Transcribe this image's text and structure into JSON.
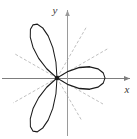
{
  "figure": {
    "title": "",
    "background_color": "#ffffff",
    "width": 137,
    "height": 139
  },
  "axes": {
    "x_label": "x",
    "y_label": "y",
    "x_axis_color": "#7d7d7d",
    "y_axis_color": "#9a9a9a",
    "origin_px": [
      57,
      78
    ],
    "arrowheads": true
  },
  "curve": {
    "label": "",
    "color": "#1a1a1a",
    "line_width": 1.0,
    "style": "solid"
  },
  "tangent_lines": {
    "color": "#b0b0b0",
    "style": "dashed",
    "dash_pattern": "3 2",
    "line_width": 0.8,
    "count": 6
  },
  "chart_data": {
    "type": "line",
    "title": "",
    "xlabel": "x",
    "ylabel": "y",
    "subtitle": "",
    "grid": false,
    "legend": [],
    "legend_position": "none",
    "coordinate_system": "polar",
    "equation": "r = cos(3θ)",
    "petals": 3,
    "petal_angles_deg": [
      0,
      120,
      240
    ],
    "petal_tip_radius": 1.0,
    "tangent_angles_deg": [
      30,
      90,
      150,
      210,
      270,
      330
    ],
    "xlim": [
      -1.15,
      1.55
    ],
    "ylim": [
      -1.6,
      1.6
    ],
    "annotations": [
      {
        "text": "y",
        "x": 0.05,
        "y": 1.52
      },
      {
        "text": "x",
        "x": 1.48,
        "y": -0.22
      }
    ],
    "series": [
      {
        "name": "r = cos(3θ)",
        "theta_deg": [
          0,
          5,
          10,
          15,
          20,
          25,
          30,
          35,
          40,
          45,
          50,
          55,
          60,
          65,
          70,
          75,
          80,
          85,
          90,
          95,
          100,
          105,
          110,
          115,
          120,
          125,
          130,
          135,
          140,
          145,
          150,
          155,
          160,
          165,
          170,
          175,
          180,
          185,
          190,
          195,
          200,
          205,
          210,
          215,
          220,
          225,
          230,
          235,
          240,
          245,
          250,
          255,
          260,
          265,
          270,
          275,
          280,
          285,
          290,
          295,
          300,
          305,
          310,
          315,
          320,
          325,
          330,
          335,
          340,
          345,
          350,
          355,
          360
        ],
        "r": [
          1.0,
          0.966,
          0.866,
          0.707,
          0.5,
          0.259,
          0.0,
          -0.259,
          -0.5,
          -0.707,
          -0.866,
          -0.966,
          -1.0,
          -0.966,
          -0.866,
          -0.707,
          -0.5,
          -0.259,
          0.0,
          0.259,
          0.5,
          0.707,
          0.866,
          0.966,
          1.0,
          0.966,
          0.866,
          0.707,
          0.5,
          0.259,
          0.0,
          -0.259,
          -0.5,
          -0.707,
          -0.866,
          -0.966,
          -1.0,
          -0.966,
          -0.866,
          -0.707,
          -0.5,
          -0.259,
          0.0,
          0.259,
          0.5,
          0.707,
          0.866,
          0.966,
          1.0,
          0.966,
          0.866,
          0.707,
          0.5,
          0.259,
          0.0,
          -0.259,
          -0.5,
          -0.707,
          -0.866,
          -0.966,
          -1.0,
          -0.966,
          -0.866,
          -0.707,
          -0.5,
          -0.259,
          0.0,
          0.259,
          0.5,
          0.707,
          0.866,
          0.966,
          1.0
        ]
      }
    ]
  }
}
